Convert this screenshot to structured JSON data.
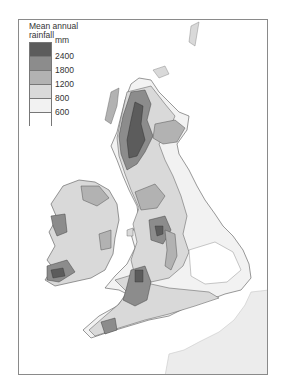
{
  "legend": {
    "title_line1": "Mean annual",
    "title_line2": "rainfall",
    "unit": "mm",
    "classes": [
      {
        "label": "2400",
        "color": "#5c5c5c",
        "range": ">2400"
      },
      {
        "label": "1800",
        "color": "#8c8c8c",
        "range": "1800-2400"
      },
      {
        "label": "1200",
        "color": "#b2b2b2",
        "range": "1200-1800"
      },
      {
        "label": "800",
        "color": "#d9d9d9",
        "range": "800-1200"
      },
      {
        "label": "600",
        "color": "#f2f2f2",
        "range": "600-800"
      },
      {
        "label": "",
        "color": "#ffffff",
        "range": "<600"
      }
    ]
  },
  "map": {
    "subject": "Mean annual rainfall, British Isles",
    "regions": [
      "Scotland",
      "Ireland",
      "England",
      "Wales",
      "France (partial)"
    ],
    "colors": {
      "very_high": "#5c5c5c",
      "high": "#8c8c8c",
      "medium": "#b2b2b2",
      "low": "#d9d9d9",
      "very_low": "#f2f2f2",
      "continent": "#ececec",
      "contour": "#555555",
      "frame": "#8a8a8a"
    }
  }
}
